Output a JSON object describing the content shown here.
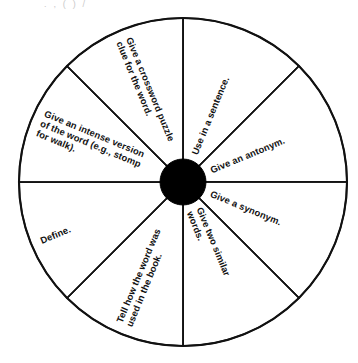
{
  "page": {
    "background_color": "#ffffff",
    "ink_color": "#111111",
    "hub_color": "#000000"
  },
  "top_cropped_artifact": {
    "visible": true,
    "text": ". , ( ) /",
    "note": "faint clipped descenders of a line of text above the crop"
  },
  "wheel": {
    "name": "vocabulary-word-wheel",
    "center_x": 183,
    "center_y": 182,
    "radius": 164,
    "hub_radius": 23,
    "sector_count": 8,
    "sector_angle_degrees": 45,
    "sectors": [
      {
        "index": 0,
        "name": "sector-use-in-a-sentence",
        "label": "Use in a sentence.",
        "lines": [
          "Use in a sentence."
        ],
        "start_angle": -90,
        "end_angle": -45,
        "text_angle": -67.5,
        "orientation": "upright"
      },
      {
        "index": 1,
        "name": "sector-give-an-antonym",
        "label": "Give an antonym.",
        "lines": [
          "Give an antonym."
        ],
        "start_angle": -45,
        "end_angle": 0,
        "text_angle": -22.5,
        "orientation": "upright"
      },
      {
        "index": 2,
        "name": "sector-give-a-synonym",
        "label": "Give a synonym.",
        "lines": [
          "Give a synonym."
        ],
        "start_angle": 0,
        "end_angle": 45,
        "text_angle": 22.5,
        "orientation": "upright"
      },
      {
        "index": 3,
        "name": "sector-give-two-similar-words",
        "label": "Give two similar words.",
        "lines": [
          "Give two similar",
          "words."
        ],
        "start_angle": 45,
        "end_angle": 90,
        "text_angle": 67.5,
        "orientation": "upright"
      },
      {
        "index": 4,
        "name": "sector-tell-how-the-word-was-used-in-the-book",
        "label": "Tell how the word was used in the book.",
        "lines": [
          "Tell how the word was",
          "used in the book."
        ],
        "start_angle": 90,
        "end_angle": 135,
        "text_angle": 112.5,
        "orientation": "inverted"
      },
      {
        "index": 5,
        "name": "sector-define",
        "label": "Define.",
        "lines": [
          "Define."
        ],
        "start_angle": 135,
        "end_angle": 180,
        "text_angle": 157.5,
        "orientation": "inverted"
      },
      {
        "index": 6,
        "name": "sector-give-an-intense-version",
        "label": "Give an intense version of the word (e.g., stomp for walk).",
        "lines": [
          "Give an intense version",
          "of the word (e.g., stomp",
          "for walk)."
        ],
        "start_angle": 180,
        "end_angle": 225,
        "text_angle": 202.5,
        "orientation": "inverted"
      },
      {
        "index": 7,
        "name": "sector-give-a-crossword-puzzle-clue",
        "label": "Give a crossword puzzle clue for the word.",
        "lines": [
          "Give a crossword puzzle",
          "clue for the word."
        ],
        "start_angle": 225,
        "end_angle": 270,
        "text_angle": 247.5,
        "orientation": "inverted"
      }
    ]
  }
}
